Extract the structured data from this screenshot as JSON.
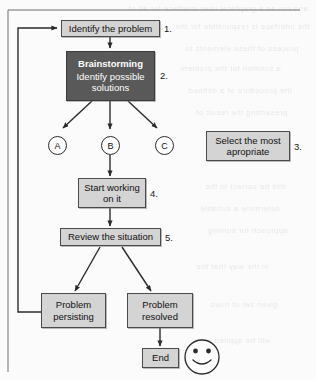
{
  "figure": {
    "bleed_text": [
      "and run as a graphical user interface for all of",
      "the interface is responsible for the",
      "process of these elements to",
      "a solution for the problem",
      "the procedure of a defined",
      "presenting the result of",
      "this be correct in the",
      "determine a suitable",
      "approach for solving",
      "in the way that the",
      "given set of rules",
      "will be applied"
    ]
  },
  "nodes": {
    "identify": {
      "label": "Identify the problem",
      "number": "1."
    },
    "brainstorm": {
      "header": "Brainstorming",
      "line1": "Identify possible",
      "line2": "solutions",
      "number": "2."
    },
    "select": {
      "line1": "Select the most",
      "line2": "apropriate",
      "number": "3."
    },
    "start": {
      "line1": "Start working",
      "line2": "on it",
      "number": "4."
    },
    "review": {
      "label": "Review the situation",
      "number": "5."
    },
    "persisting": {
      "line1": "Problem",
      "line2": "persisting"
    },
    "resolved": {
      "line1": "Problem",
      "line2": "resolved"
    },
    "end": {
      "label": "End"
    }
  },
  "options": [
    {
      "label": "A"
    },
    {
      "label": "B"
    },
    {
      "label": "C"
    }
  ],
  "icons": {
    "smiley": "smiley-face-icon"
  },
  "colors": {
    "box_fill": "#d4d4d4",
    "box_border": "#4a4a4a",
    "dark_box_fill": "#595959",
    "dark_box_text": "#ffffff",
    "line": "#2b2b2b",
    "page": "#fbfbfb"
  }
}
